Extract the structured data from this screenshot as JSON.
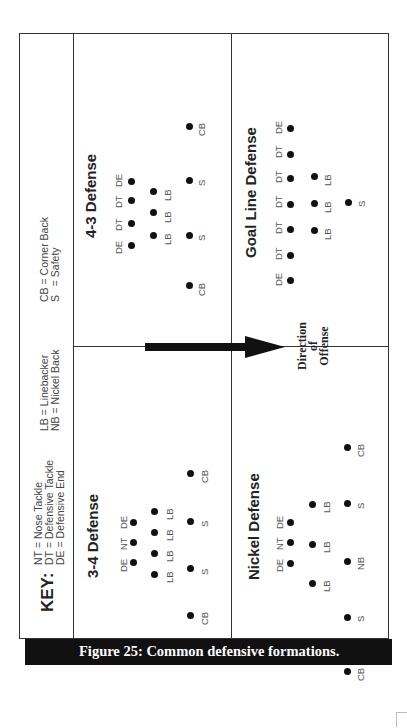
{
  "figure": {
    "caption": "Figure 25:  Common defensive formations.",
    "colors": {
      "caption_bg": "#111111",
      "caption_text": "#ffffff",
      "dot": "#111111",
      "border": "#333333"
    }
  },
  "key": {
    "heading": "KEY:",
    "entries": [
      {
        "abbr": "NT",
        "eq": "=",
        "meaning": "Nose Tackle"
      },
      {
        "abbr": "DT",
        "eq": "=",
        "meaning": "Defensive Tackle"
      },
      {
        "abbr": "DE",
        "eq": "=",
        "meaning": "Defensive End"
      },
      {
        "abbr": "LB",
        "eq": "=",
        "meaning": "Linebacker"
      },
      {
        "abbr": "NB",
        "eq": "=",
        "meaning": "Nickel Back"
      },
      {
        "abbr": "CB",
        "eq": "=",
        "meaning": "Corner Back"
      },
      {
        "abbr": "S",
        "eq": "=",
        "meaning": "Safety"
      }
    ]
  },
  "direction": {
    "line1": "Direction",
    "line2": "of",
    "line3": "Offense"
  },
  "formations": {
    "f34": {
      "title": "3-4 Defense",
      "players": [
        "DE",
        "NT",
        "DE",
        "LB",
        "LB",
        "LB",
        "LB",
        "CB",
        "S",
        "S",
        "CB"
      ]
    },
    "f43": {
      "title": "4-3 Defense",
      "players": [
        "DE",
        "DT",
        "DT",
        "DE",
        "LB",
        "LB",
        "LB",
        "CB",
        "S",
        "S",
        "CB"
      ]
    },
    "nickel": {
      "title": "Nickel Defense",
      "players": [
        "DE",
        "NT",
        "DE",
        "LB",
        "LB",
        "LB",
        "CB",
        "S",
        "NB",
        "S",
        "CB"
      ]
    },
    "goalline": {
      "title": "Goal Line Defense",
      "players": [
        "DE",
        "DT",
        "DT",
        "DT",
        "DT",
        "DT",
        "DE",
        "LB",
        "LB",
        "LB",
        "S"
      ]
    }
  }
}
